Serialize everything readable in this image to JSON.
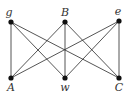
{
  "diagram": {
    "type": "bipartite-graph",
    "name": "K3,3",
    "nodes": [
      {
        "id": "g",
        "label": "g",
        "x": 11,
        "y": 22,
        "lx": 9,
        "ly": 16
      },
      {
        "id": "B",
        "label": "B",
        "x": 65,
        "y": 22,
        "lx": 65,
        "ly": 16
      },
      {
        "id": "e",
        "label": "e",
        "x": 119,
        "y": 21,
        "lx": 118,
        "ly": 15
      },
      {
        "id": "A",
        "label": "A",
        "x": 11,
        "y": 78,
        "lx": 11,
        "ly": 91
      },
      {
        "id": "w",
        "label": "w",
        "x": 65,
        "y": 78,
        "lx": 65,
        "ly": 91
      },
      {
        "id": "C",
        "label": "C",
        "x": 119,
        "y": 78,
        "lx": 119,
        "ly": 91
      }
    ],
    "edges": [
      [
        "g",
        "A"
      ],
      [
        "g",
        "w"
      ],
      [
        "g",
        "C"
      ],
      [
        "B",
        "A"
      ],
      [
        "B",
        "w"
      ],
      [
        "B",
        "C"
      ],
      [
        "e",
        "A"
      ],
      [
        "e",
        "w"
      ],
      [
        "e",
        "C"
      ]
    ],
    "colors": {
      "edge": "#2a2a2a",
      "node": "#111111",
      "label": "#333333"
    }
  }
}
